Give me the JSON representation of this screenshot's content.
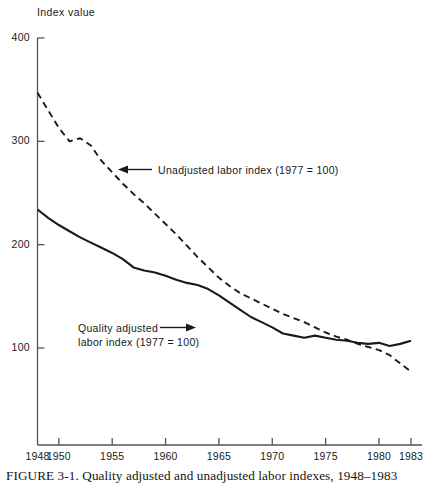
{
  "figure": {
    "caption": "FIGURE 3-1.  Quality adjusted and unadjusted labor indexes, 1948–1983",
    "y_axis_title": "Index value"
  },
  "annotations": {
    "unadjusted": {
      "line1": "Unadjusted labor index (1977 = 100)",
      "arrow": "←"
    },
    "quality_adjusted": {
      "line1": "Quality adjusted",
      "line2": "labor index (1977 = 100)",
      "arrow": "→"
    }
  },
  "chart_data": {
    "type": "line",
    "xlabel": "",
    "ylabel": "Index value",
    "xlim": [
      1948,
      1983
    ],
    "ylim": [
      0,
      400
    ],
    "grid": false,
    "legend_position": "inline-annotations",
    "y_ticks": [
      100,
      200,
      300,
      400
    ],
    "x_ticks": [
      1948,
      1950,
      1955,
      1960,
      1965,
      1970,
      1975,
      1980,
      1983
    ],
    "x_tick_labels": [
      "1948",
      "1950",
      "1955",
      "1960",
      "1965",
      "1970",
      "1975",
      "1980",
      "1983"
    ],
    "y_tick_labels": [
      "100",
      "200",
      "300",
      "400"
    ],
    "x": [
      1948,
      1949,
      1950,
      1951,
      1952,
      1953,
      1954,
      1955,
      1956,
      1957,
      1958,
      1959,
      1960,
      1961,
      1962,
      1963,
      1964,
      1965,
      1966,
      1967,
      1968,
      1969,
      1970,
      1971,
      1972,
      1973,
      1974,
      1975,
      1976,
      1977,
      1978,
      1979,
      1980,
      1981,
      1982,
      1983
    ],
    "series": [
      {
        "name": "Unadjusted labor index (1977 = 100)",
        "style": "dashed",
        "color": "#1a1a1a",
        "values": [
          347,
          330,
          313,
          300,
          303,
          296,
          281,
          270,
          259,
          249,
          240,
          230,
          220,
          210,
          199,
          188,
          178,
          168,
          160,
          153,
          148,
          143,
          138,
          133,
          129,
          125,
          120,
          115,
          111,
          108,
          104,
          101,
          98,
          93,
          85,
          77
        ]
      },
      {
        "name": "Quality adjusted labor index (1977 = 100)",
        "style": "solid",
        "color": "#1a1a1a",
        "values": [
          234,
          226,
          219,
          213,
          207,
          202,
          197,
          192,
          186,
          178,
          175,
          173,
          170,
          166,
          163,
          161,
          157,
          151,
          144,
          137,
          130,
          125,
          120,
          114,
          112,
          110,
          112,
          110,
          108,
          107,
          105,
          104,
          105,
          102,
          104,
          107
        ]
      }
    ]
  },
  "colors": {
    "ink": "#1a1a1a",
    "axis": "#555555",
    "background": "#ffffff"
  }
}
